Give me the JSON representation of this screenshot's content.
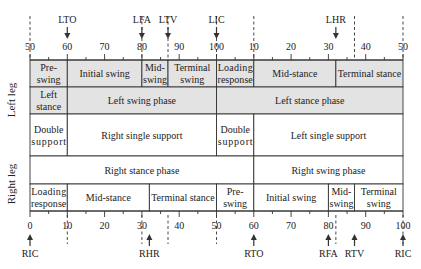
{
  "diagram": {
    "type": "gait-cycle-timeline",
    "colors": {
      "shaded": "#e3e3e3",
      "white": "#ffffff",
      "line": "#333333",
      "text": "#222222"
    },
    "side_labels": {
      "left_leg": "Left leg",
      "right_leg": "Right leg"
    },
    "top_axis": {
      "tick_labels": [
        "50",
        "60",
        "70",
        "80",
        "90",
        "100",
        "10",
        "20",
        "30",
        "40",
        "50"
      ],
      "positions": [
        0,
        10,
        20,
        30,
        40,
        50,
        60,
        70,
        80,
        90,
        100
      ],
      "dashed_markers": [
        0,
        30,
        37,
        50,
        60,
        87,
        100
      ],
      "events": [
        {
          "label": "LTO",
          "pos": 10
        },
        {
          "label": "LFA",
          "pos": 30
        },
        {
          "label": "LTV",
          "pos": 37
        },
        {
          "label": "LIC",
          "pos": 50
        },
        {
          "label": "LHR",
          "pos": 82
        }
      ]
    },
    "bottom_axis": {
      "tick_labels": [
        "0",
        "10",
        "20",
        "30",
        "40",
        "50",
        "60",
        "70",
        "80",
        "90",
        "100"
      ],
      "positions": [
        0,
        10,
        20,
        30,
        40,
        50,
        60,
        70,
        80,
        90,
        100
      ],
      "dashed_markers": [
        10,
        30,
        37,
        50,
        82,
        100
      ],
      "events": [
        {
          "label": "RIC",
          "pos": 0
        },
        {
          "label": "RHR",
          "pos": 32
        },
        {
          "label": "RTO",
          "pos": 60
        },
        {
          "label": "RFA",
          "pos": 80
        },
        {
          "label": "RTV",
          "pos": 87
        },
        {
          "label": "RIC",
          "pos": 100
        }
      ]
    },
    "rows": [
      {
        "name": "left-leg-subphases",
        "shade": "shaded",
        "cells": [
          {
            "from": 0,
            "to": 10,
            "lines": [
              "Pre-",
              "swing"
            ]
          },
          {
            "from": 10,
            "to": 30,
            "lines": [
              "Initial swing"
            ]
          },
          {
            "from": 30,
            "to": 37,
            "lines": [
              "Mid-",
              "swing"
            ]
          },
          {
            "from": 37,
            "to": 50,
            "lines": [
              "Terminal",
              "swing"
            ]
          },
          {
            "from": 50,
            "to": 60,
            "lines": [
              "Loading",
              "response"
            ]
          },
          {
            "from": 60,
            "to": 82,
            "lines": [
              "Mid-stance"
            ]
          },
          {
            "from": 82,
            "to": 100,
            "lines": [
              "Terminal stance"
            ]
          }
        ]
      },
      {
        "name": "left-leg-phases",
        "shade": "shaded",
        "cells": [
          {
            "from": 0,
            "to": 10,
            "lines": [
              "Left",
              "stance"
            ]
          },
          {
            "from": 10,
            "to": 50,
            "lines": [
              "Left swing phase"
            ]
          },
          {
            "from": 50,
            "to": 100,
            "lines": [
              "Left stance phase"
            ]
          }
        ]
      },
      {
        "name": "support-phases",
        "shade": "white",
        "cells": [
          {
            "from": 0,
            "to": 10,
            "lines": [
              "Double",
              "support"
            ]
          },
          {
            "from": 10,
            "to": 50,
            "lines": [
              "Right single support"
            ]
          },
          {
            "from": 50,
            "to": 60,
            "lines": [
              "Double",
              "support"
            ]
          },
          {
            "from": 60,
            "to": 100,
            "lines": [
              "Left single support"
            ]
          }
        ]
      },
      {
        "name": "right-leg-phases",
        "shade": "white",
        "cells": [
          {
            "from": 0,
            "to": 60,
            "lines": [
              "Right stance phase"
            ]
          },
          {
            "from": 60,
            "to": 100,
            "lines": [
              "Right swing phase"
            ]
          }
        ]
      },
      {
        "name": "right-leg-subphases",
        "shade": "white",
        "cells": [
          {
            "from": 0,
            "to": 10,
            "lines": [
              "Loading",
              "response"
            ]
          },
          {
            "from": 10,
            "to": 32,
            "lines": [
              "Mid-stance"
            ]
          },
          {
            "from": 32,
            "to": 50,
            "lines": [
              "Terminal stance"
            ]
          },
          {
            "from": 50,
            "to": 60,
            "lines": [
              "Pre-",
              "swing"
            ]
          },
          {
            "from": 60,
            "to": 80,
            "lines": [
              "Initial swing"
            ]
          },
          {
            "from": 80,
            "to": 87,
            "lines": [
              "Mid-",
              "swing"
            ]
          },
          {
            "from": 87,
            "to": 100,
            "lines": [
              "Terminal",
              "swing"
            ]
          }
        ]
      }
    ]
  }
}
